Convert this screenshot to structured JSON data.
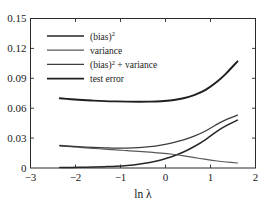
{
  "chart_data": {
    "type": "line",
    "title": "",
    "xlabel": "ln λ",
    "ylabel": "",
    "xlim": [
      -3,
      2
    ],
    "ylim": [
      0,
      0.15
    ],
    "xticks": [
      -3,
      -2,
      -1,
      0,
      1,
      2
    ],
    "xtick_labels": [
      "−3",
      "−2",
      "−1",
      "0",
      "1",
      "2"
    ],
    "yticks": [
      0,
      0.03,
      0.06,
      0.09,
      0.12,
      0.15
    ],
    "ytick_labels": [
      "0",
      "0.03",
      "0.06",
      "0.09",
      "0.12",
      "0.15"
    ],
    "grid": false,
    "legend_position": "upper left",
    "data_xrange": [
      -2.35,
      1.6
    ],
    "x": [
      -2.35,
      -2.1,
      -1.85,
      -1.6,
      -1.35,
      -1.1,
      -0.85,
      -0.6,
      -0.35,
      -0.1,
      0.15,
      0.4,
      0.65,
      0.9,
      1.15,
      1.35,
      1.6
    ],
    "series": [
      {
        "name": "(bias)²",
        "label_base": "(bias)",
        "label_sup": "2",
        "label_tail": "",
        "color": "#262626",
        "linewidth": 1.5,
        "values": [
          0.0004,
          0.0005,
          0.0007,
          0.0009,
          0.0013,
          0.0018,
          0.0026,
          0.0038,
          0.0055,
          0.008,
          0.0115,
          0.016,
          0.0218,
          0.0288,
          0.037,
          0.0425,
          0.048
        ]
      },
      {
        "name": "variance",
        "label_base": "variance",
        "label_sup": "",
        "label_tail": "",
        "color": "#595959",
        "linewidth": 1.2,
        "values": [
          0.0222,
          0.0213,
          0.0205,
          0.0197,
          0.0189,
          0.0181,
          0.0174,
          0.0167,
          0.0159,
          0.015,
          0.0138,
          0.0122,
          0.0104,
          0.0086,
          0.007,
          0.006,
          0.005
        ]
      },
      {
        "name": "(bias)² + variance",
        "label_base": "(bias)",
        "label_sup": "2",
        "label_tail": " + variance",
        "color": "#3d3d3d",
        "linewidth": 1.3,
        "values": [
          0.0226,
          0.0218,
          0.0212,
          0.0206,
          0.0202,
          0.0199,
          0.02,
          0.0205,
          0.0214,
          0.023,
          0.0253,
          0.0282,
          0.0322,
          0.0374,
          0.044,
          0.0485,
          0.053
        ]
      },
      {
        "name": "test error",
        "color": "#1f1f1f",
        "linewidth": 1.9,
        "label_base": "test error",
        "label_sup": "",
        "label_tail": "",
        "values": [
          0.07,
          0.069,
          0.0682,
          0.0676,
          0.0671,
          0.0668,
          0.0666,
          0.0665,
          0.0666,
          0.067,
          0.068,
          0.07,
          0.0733,
          0.0786,
          0.0867,
          0.095,
          0.107
        ]
      }
    ]
  },
  "figure": {
    "axis_color": "#2b2b2b",
    "background": "#ffffff",
    "xlabel": "ln λ"
  },
  "legend": {
    "entries": [
      {
        "base": "(bias)",
        "sup": "2",
        "tail": ""
      },
      {
        "base": "variance",
        "sup": "",
        "tail": ""
      },
      {
        "base": "(bias)",
        "sup": "2",
        "tail": " + variance"
      },
      {
        "base": "test error",
        "sup": "",
        "tail": ""
      }
    ]
  }
}
